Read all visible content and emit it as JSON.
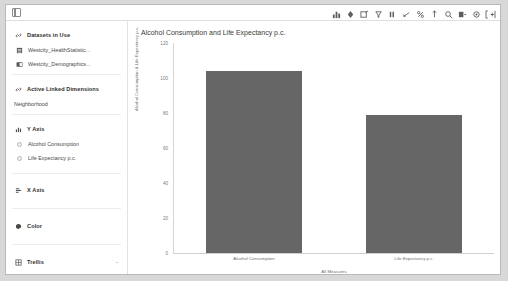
{
  "window": {
    "panel_toggle_icon": "panel-toggle-icon"
  },
  "toolbar": {
    "items": [
      {
        "name": "chart-type-icon",
        "glyph": "bar-chart"
      },
      {
        "name": "color-fill-icon",
        "glyph": "fill"
      },
      {
        "name": "edit-icon",
        "glyph": "edit"
      },
      {
        "name": "filter-icon",
        "glyph": "filter"
      },
      {
        "name": "list-icon",
        "glyph": "list"
      },
      {
        "name": "marking-icon",
        "glyph": "marking"
      },
      {
        "name": "percent-icon",
        "glyph": "percent"
      },
      {
        "name": "annotation-icon",
        "glyph": "annotation"
      },
      {
        "name": "zoom-icon",
        "glyph": "zoom"
      },
      {
        "name": "export-icon",
        "glyph": "export"
      },
      {
        "name": "settings-icon",
        "glyph": "settings"
      },
      {
        "name": "fullscreen-icon",
        "glyph": "fullscreen"
      }
    ]
  },
  "sidebar": {
    "sections": [
      {
        "name": "datasets-in-use",
        "title": "Datasets in Use",
        "icon": "link-icon",
        "items": [
          {
            "name": "dataset-westcity-healthstatistics",
            "label": "Westcity_HealthStatistic...",
            "icon": "table-icon"
          },
          {
            "name": "dataset-westcity-demographics",
            "label": "Westcity_Demographics...",
            "icon": "table-icon"
          }
        ]
      },
      {
        "name": "active-linked-dimensions",
        "title": "Active Linked Dimensions",
        "icon": "link-icon",
        "items": [
          {
            "name": "dimension-neighborhood",
            "label": "Neighborhood",
            "icon": "none"
          }
        ]
      },
      {
        "name": "y-axis",
        "title": "Y Axis",
        "icon": "bar-chart-icon",
        "items": [
          {
            "name": "y-axis-measure-alcohol-consumption",
            "label": "Alcohol Consumption",
            "icon": "dot-icon"
          },
          {
            "name": "y-axis-measure-life-expectancy",
            "label": "Life Expectancy p.c.",
            "icon": "dot-icon"
          }
        ]
      },
      {
        "name": "x-axis",
        "title": "X Axis",
        "icon": "axis-icon",
        "items": []
      },
      {
        "name": "color",
        "title": "Color",
        "icon": "palette-icon",
        "items": []
      },
      {
        "name": "trellis",
        "title": "Trellis",
        "icon": "grid-icon",
        "items": [],
        "caret": "⌄"
      }
    ]
  },
  "chart_data": {
    "type": "bar",
    "title": "Alcohol Consumption and Life Expectancy p.c.",
    "categories": [
      "Alcohol Consumption",
      "Life Expectancy p.c."
    ],
    "values": [
      104,
      79
    ],
    "xlabel": "All Measures",
    "ylabel": "Alcohol Consumption & Life Expectancy p.c.",
    "ylim": [
      0,
      120
    ],
    "yticks": [
      0,
      20,
      40,
      60,
      80,
      100,
      120
    ],
    "grid": false,
    "legend": "none",
    "bar_color": "#666666"
  }
}
